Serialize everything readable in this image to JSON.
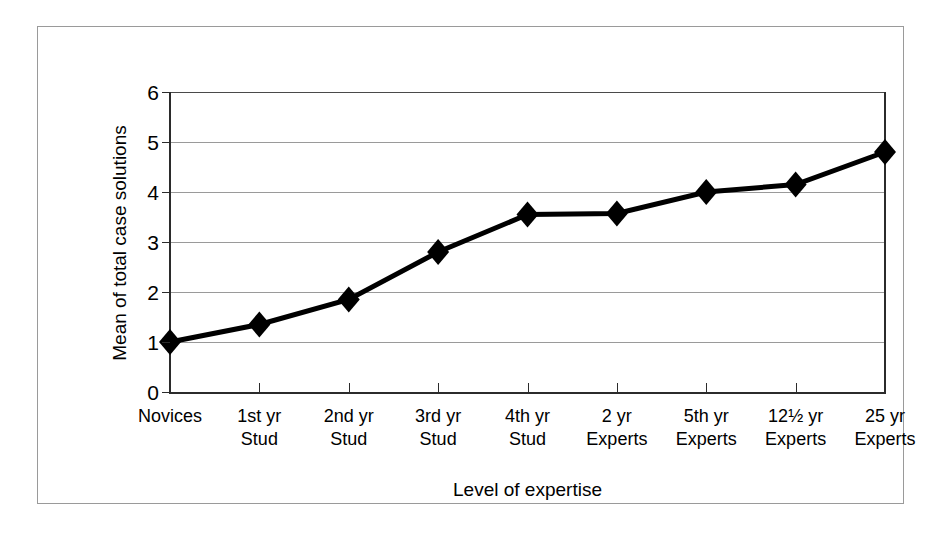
{
  "chart_data": {
    "type": "line",
    "title": "",
    "xlabel": "Level of expertise",
    "ylabel": "Mean of total case solutions",
    "categories": [
      "Novices",
      "1st yr Stud",
      "2nd yr Stud",
      "3rd yr Stud",
      "4th yr Stud",
      "2 yr Experts",
      "5th yr Experts",
      "12½ yr Experts",
      "25 yr Experts"
    ],
    "category_lines": [
      {
        "line1": "Novices",
        "line2": ""
      },
      {
        "line1": "1st yr",
        "line2": "Stud"
      },
      {
        "line1": "2nd yr",
        "line2": "Stud"
      },
      {
        "line1": "3rd yr",
        "line2": "Stud"
      },
      {
        "line1": "4th yr",
        "line2": "Stud"
      },
      {
        "line1": "2 yr",
        "line2": "Experts"
      },
      {
        "line1": "5th yr",
        "line2": "Experts"
      },
      {
        "line1": "12½ yr",
        "line2": "Experts"
      },
      {
        "line1": "25 yr",
        "line2": "Experts"
      }
    ],
    "values": [
      1.0,
      1.35,
      1.85,
      2.8,
      3.55,
      3.57,
      4.0,
      4.15,
      4.8
    ],
    "ylim": [
      0,
      6
    ],
    "yticks": [
      0,
      1,
      2,
      3,
      4,
      5,
      6
    ],
    "ytick_labels": [
      "0",
      "1",
      "2",
      "3",
      "4",
      "5",
      "6"
    ],
    "grid": true,
    "legend": "none",
    "marker": "diamond",
    "line_color": "#000000",
    "marker_color": "#000000",
    "grid_color": "#9a9a9a",
    "background_color": "#ffffff"
  },
  "axis": {
    "y_title": "Mean of total case solutions",
    "x_title": "Level of expertise"
  }
}
